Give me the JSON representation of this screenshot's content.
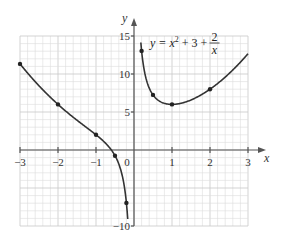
{
  "chart_data": {
    "type": "line",
    "title": "",
    "annotation": {
      "lhs": "y = x",
      "exponent": "2",
      "mid": " + 3 + ",
      "frac_num": "2",
      "frac_den": "x"
    },
    "xlabel": "x",
    "ylabel": "y",
    "xlim": [
      -3,
      3
    ],
    "ylim": [
      -10,
      15
    ],
    "grid": true,
    "x_ticks": [
      -3,
      -2,
      -1,
      0,
      1,
      2,
      3
    ],
    "x_tick_labels": [
      "−3",
      "−2",
      "−1",
      "0",
      "1",
      "2",
      "3"
    ],
    "y_ticks": [
      -10,
      5,
      10,
      15
    ],
    "y_tick_labels": [
      "−10",
      "5",
      "10",
      "15"
    ],
    "series": [
      {
        "name": "y = x^2 + 3 + 2/x",
        "function": "x^2 + 3 + 2/x",
        "points": [
          {
            "x": -3,
            "y": 11.33
          },
          {
            "x": -2,
            "y": 6
          },
          {
            "x": -1,
            "y": 2
          },
          {
            "x": -0.5,
            "y": -0.75
          },
          {
            "x": -0.2,
            "y": -6.96
          },
          {
            "x": 0.2,
            "y": 13.04
          },
          {
            "x": 0.5,
            "y": 7.25
          },
          {
            "x": 1,
            "y": 6
          },
          {
            "x": 2,
            "y": 8
          }
        ]
      }
    ]
  }
}
